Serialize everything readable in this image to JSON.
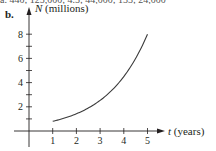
{
  "header": {
    "top_text": "a. 440; 125,000; 4.5; 44,000; 133; 24,000",
    "part_label": "b."
  },
  "chart_data": {
    "type": "line",
    "title": "",
    "xlabel": "t (years)",
    "ylabel": "N (millions)",
    "x_var": "t",
    "x_unit": "(years)",
    "y_var": "N",
    "y_unit": "(millions)",
    "x_ticks": [
      "1",
      "2",
      "3",
      "4",
      "5"
    ],
    "y_ticks": [
      "2",
      "4",
      "6",
      "8"
    ],
    "y_minor_ticks": [
      1,
      3,
      5,
      7
    ],
    "xlim": [
      0,
      5.5
    ],
    "ylim": [
      0,
      8.5
    ],
    "grid": false,
    "legend": null,
    "series": [
      {
        "name": "N(t)",
        "x": [
          1,
          1.5,
          2,
          2.5,
          3,
          3.5,
          4,
          4.5,
          5
        ],
        "values": [
          0.8,
          1.07,
          1.42,
          1.9,
          2.53,
          3.37,
          4.5,
          6.0,
          8.0
        ]
      }
    ]
  }
}
